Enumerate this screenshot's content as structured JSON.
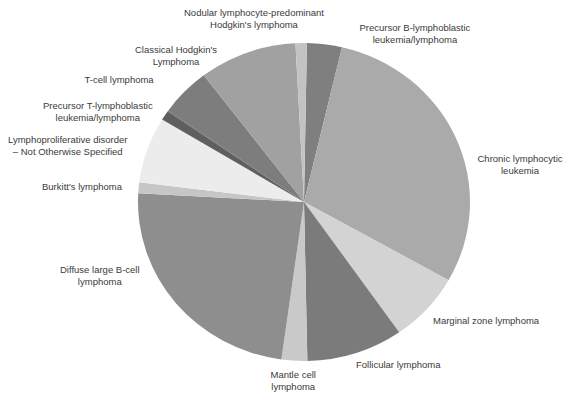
{
  "chart_data": {
    "type": "pie",
    "title": "",
    "start_angle_deg": 1,
    "direction": "clockwise",
    "center": [
      304,
      202
    ],
    "radius": [
      166,
      159
    ],
    "legend": "none",
    "slices": [
      {
        "name": "Precursor B-lymphoblastic leukemia/lymphoma",
        "value": 3.4,
        "color": "#7f7f7f"
      },
      {
        "name": "Chronic lymphocytic leukemia",
        "value": 29.5,
        "color": "#aaaaaa"
      },
      {
        "name": "Marginal zone lymphoma",
        "value": 7.1,
        "color": "#d3d3d3"
      },
      {
        "name": "Follicular lymphoma",
        "value": 9.4,
        "color": "#7b7b7b"
      },
      {
        "name": "Mantle cell lymphoma",
        "value": 2.5,
        "color": "#c9c9c9"
      },
      {
        "name": "Diffuse large B-cell lymphoma",
        "value": 23.7,
        "color": "#8e8e8e"
      },
      {
        "name": "Burkitt's lymphoma",
        "value": 1.1,
        "color": "#c6c6c6"
      },
      {
        "name": "Lymphoproliferative disorder – Not Otherwise Specified",
        "value": 6.7,
        "color": "#ececec"
      },
      {
        "name": "Precursor T-lymphoblastic leukemia/lymphoma",
        "value": 1.0,
        "color": "#5f5f5f"
      },
      {
        "name": "T-cell lymphoma",
        "value": 5.0,
        "color": "#7d7d7d"
      },
      {
        "name": "Classical Hodgkin's Lymphoma",
        "value": 9.5,
        "color": "#a1a1a1"
      },
      {
        "name": "Nodular lymphocyte-predominant Hodgkin's lymphoma",
        "value": 1.1,
        "color": "#c3c3c3"
      }
    ]
  },
  "labels": [
    {
      "lines": [
        "Precursor B-lymphoblastic",
        "leukemia/lymphoma"
      ],
      "x": 415,
      "y": 22
    },
    {
      "lines": [
        "Chronic lymphocytic",
        "leukemia"
      ],
      "x": 520,
      "y": 153
    },
    {
      "lines": [
        "Marginal zone lymphoma"
      ],
      "x": 486,
      "y": 315
    },
    {
      "lines": [
        "Follicular lymphoma"
      ],
      "x": 398,
      "y": 359
    },
    {
      "lines": [
        "Mantle cell",
        "lymphoma"
      ],
      "x": 293,
      "y": 369
    },
    {
      "lines": [
        "Diffuse large B-cell",
        "lymphoma"
      ],
      "x": 100,
      "y": 264
    },
    {
      "lines": [
        "Burkitt's lymphoma"
      ],
      "x": 82,
      "y": 181
    },
    {
      "lines": [
        "Lymphoproliferative disorder",
        "– Not Otherwise Specified"
      ],
      "x": 68,
      "y": 134
    },
    {
      "lines": [
        "Precursor T-lymphoblastic",
        "leukemia/lymphoma"
      ],
      "x": 98,
      "y": 100
    },
    {
      "lines": [
        "T-cell lymphoma"
      ],
      "x": 119,
      "y": 74
    },
    {
      "lines": [
        "Classical Hodgkin's",
        "Lymphoma"
      ],
      "x": 176,
      "y": 44
    },
    {
      "lines": [
        "Nodular lymphocyte-predominant",
        "Hodgkin's lymphoma"
      ],
      "x": 254,
      "y": 7
    }
  ]
}
